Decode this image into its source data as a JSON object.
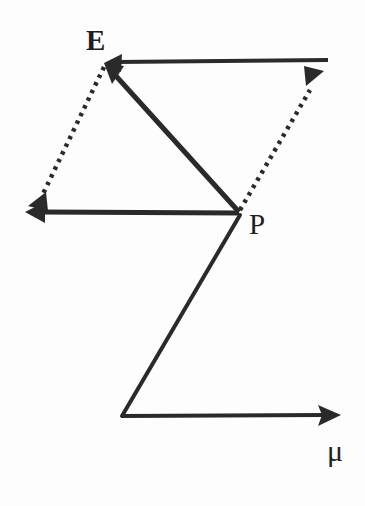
{
  "figure": {
    "background_color": "#fdfdfd",
    "ink_color": "#2a2a2a",
    "width": 365,
    "height": 506
  },
  "labels": {
    "point_e": "E",
    "point_p": "P",
    "axis_mu": "μ"
  },
  "geometry": {
    "points": {
      "E": {
        "x": 105,
        "y": 63
      },
      "P": {
        "x": 239,
        "y": 213
      },
      "top_right": {
        "x": 328,
        "y": 60
      },
      "left_tip": {
        "x": 26,
        "y": 212
      },
      "dotted_left_tip": {
        "x": 29,
        "y": 207
      },
      "dotted_right_tip": {
        "x": 322,
        "y": 73
      },
      "z_corner": {
        "x": 122,
        "y": 417
      },
      "mu_tip": {
        "x": 340,
        "y": 415
      }
    },
    "edges": [
      {
        "name": "top-horizontal-arrow",
        "style": "solid",
        "from": "top_right",
        "to": "E",
        "arrow_at": "E"
      },
      {
        "name": "middle-horizontal-arrow",
        "style": "solid",
        "from": "P",
        "to": "left_tip",
        "arrow_at": "left_tip"
      },
      {
        "name": "diagonal-p-to-e-arrow",
        "style": "solid",
        "from": "P",
        "to": "E",
        "arrow_at": "E"
      },
      {
        "name": "dotted-e-to-left-arrow",
        "style": "dotted",
        "from": "E",
        "to": "dotted_left_tip",
        "arrow_at": "dotted_left_tip"
      },
      {
        "name": "dotted-p-to-upper-right-arrow",
        "style": "dotted",
        "from": "P",
        "to": "dotted_right_tip",
        "arrow_at": "dotted_right_tip"
      },
      {
        "name": "z-diagonal",
        "style": "solid",
        "from": "P",
        "to": "z_corner",
        "arrow_at": "none"
      },
      {
        "name": "mu-axis-arrow",
        "style": "solid",
        "from": "z_corner",
        "to": "mu_tip",
        "arrow_at": "mu_tip"
      }
    ]
  }
}
